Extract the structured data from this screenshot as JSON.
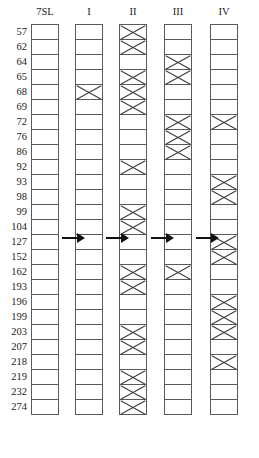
{
  "figure": {
    "row_axis_header": "7SL",
    "columns": [
      {
        "label": "7SL",
        "name": "reference"
      },
      {
        "label": "I",
        "name": "group-1"
      },
      {
        "label": "II",
        "name": "group-2"
      },
      {
        "label": "III",
        "name": "group-3"
      },
      {
        "label": "IV",
        "name": "group-4"
      }
    ],
    "row_labels": [
      "57",
      "62",
      "64",
      "65",
      "68",
      "69",
      "72",
      "76",
      "86",
      "92",
      "93",
      "98",
      "99",
      "104",
      "127",
      "152",
      "162",
      "193",
      "196",
      "199",
      "203",
      "207",
      "218",
      "219",
      "232",
      "274"
    ],
    "arrow_glyph": "→",
    "arrow_count": 4,
    "mark_symbol": "X",
    "colors": {
      "background": "#ffffff",
      "cell_border": "#5a5a5a",
      "mark": "#3a3a3a",
      "arrow": "#111111",
      "text": "#1a1a1a"
    }
  },
  "chart_data": {
    "type": "table",
    "categories": [
      "57",
      "62",
      "64",
      "65",
      "68",
      "69",
      "72",
      "76",
      "86",
      "92",
      "93",
      "98",
      "99",
      "104",
      "127",
      "152",
      "162",
      "193",
      "196",
      "199",
      "203",
      "207",
      "218",
      "219",
      "232",
      "274"
    ],
    "series": [
      {
        "name": "7SL",
        "values": [
          0,
          0,
          0,
          0,
          0,
          0,
          0,
          0,
          0,
          0,
          0,
          0,
          0,
          0,
          0,
          0,
          0,
          0,
          0,
          0,
          0,
          0,
          0,
          0,
          0,
          0
        ]
      },
      {
        "name": "I",
        "values": [
          0,
          0,
          0,
          0,
          1,
          0,
          0,
          0,
          0,
          0,
          0,
          0,
          0,
          0,
          0,
          0,
          0,
          0,
          0,
          0,
          0,
          0,
          0,
          0,
          0,
          0
        ]
      },
      {
        "name": "II",
        "values": [
          1,
          1,
          0,
          1,
          1,
          1,
          0,
          0,
          0,
          1,
          0,
          0,
          1,
          1,
          0,
          0,
          1,
          1,
          0,
          0,
          1,
          1,
          0,
          1,
          1,
          1
        ]
      },
      {
        "name": "III",
        "values": [
          0,
          0,
          1,
          1,
          0,
          0,
          1,
          1,
          1,
          0,
          0,
          0,
          0,
          0,
          0,
          0,
          1,
          0,
          0,
          0,
          0,
          0,
          0,
          0,
          0,
          0
        ]
      },
      {
        "name": "IV",
        "values": [
          0,
          0,
          0,
          0,
          0,
          0,
          1,
          0,
          0,
          0,
          1,
          1,
          0,
          0,
          1,
          1,
          0,
          0,
          1,
          1,
          1,
          0,
          1,
          0,
          0,
          0
        ]
      }
    ],
    "xlabel": "",
    "ylabel": "7SL band size",
    "grid": true,
    "legend": "none"
  }
}
